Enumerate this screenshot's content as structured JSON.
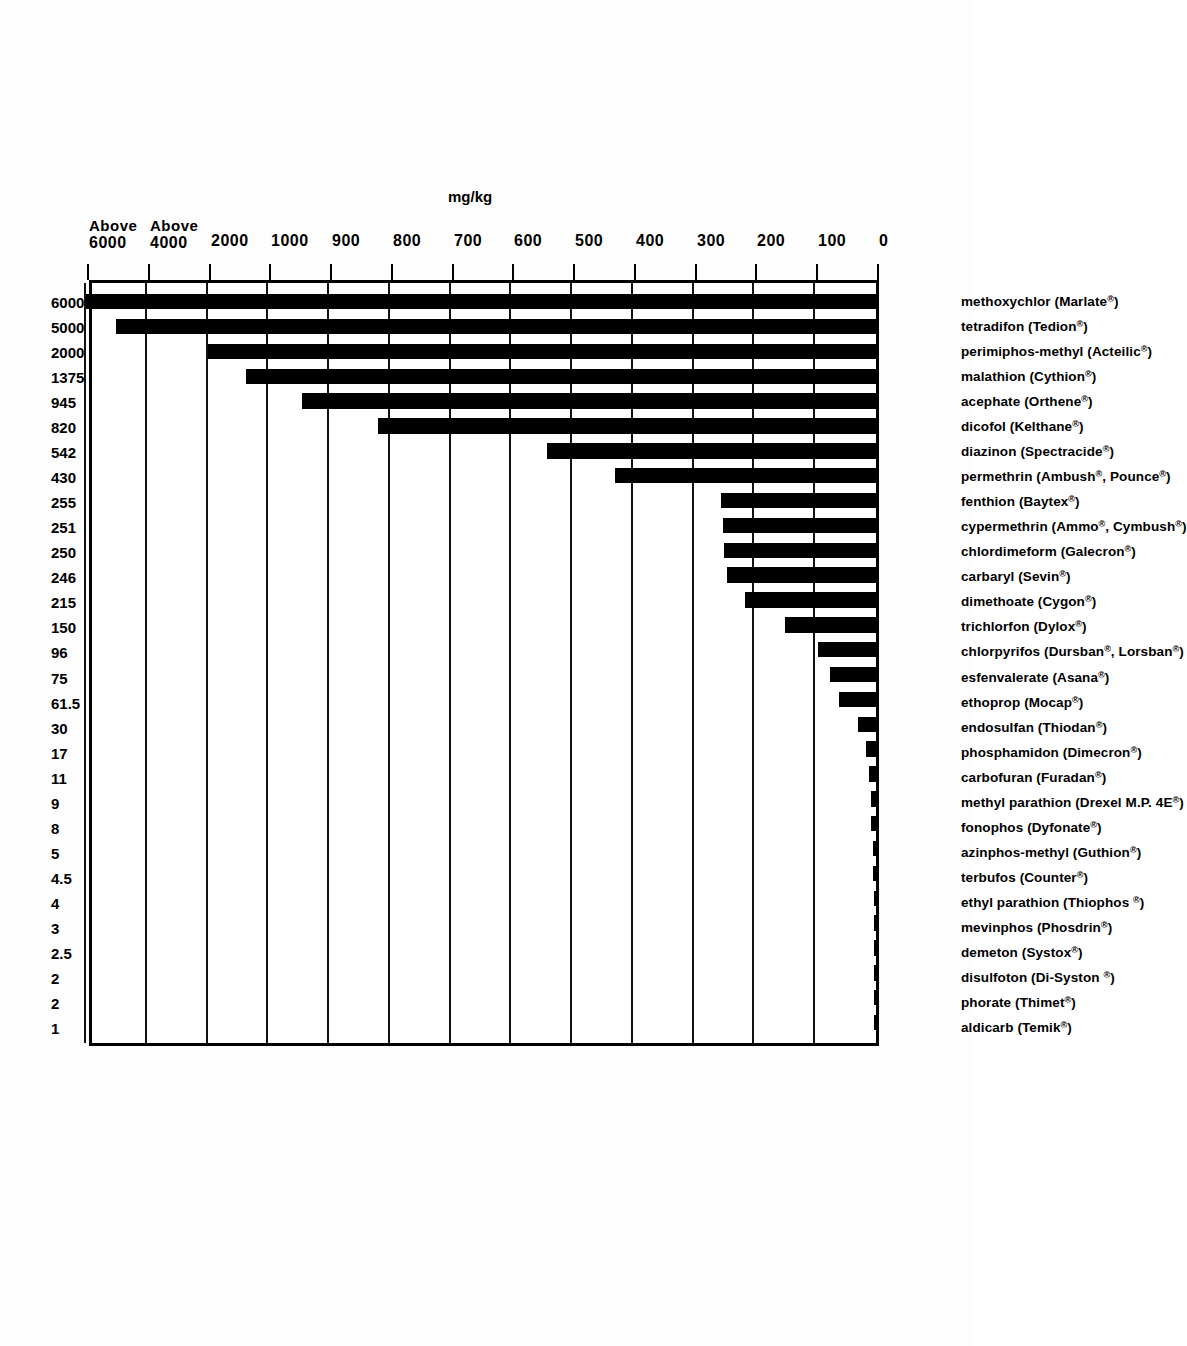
{
  "chart_data": {
    "type": "bar",
    "title_line1_main": "ACUTE ORAL LD",
    "title_line1_sub": "50",
    "title_line1_tail": "Rats mg/kg",
    "subtitle_line1": "The shorter the bar-the more toxic the chemical",
    "subtitle_line2": "if ingested",
    "xlabel": "",
    "ylabel": "mg/kg",
    "unit_label": "mg/kg",
    "grid": true,
    "legend": "none",
    "axis_scale": "piecewise / non-linear (0-1000 linear by 100, then 2000, Above 4000, Above 6000)",
    "tick_labels": [
      "0",
      "100",
      "200",
      "300",
      "400",
      "500",
      "600",
      "700",
      "800",
      "900",
      "1000",
      "2000",
      "Above 4000",
      "Above 6000"
    ],
    "tick_values": [
      0,
      100,
      200,
      300,
      400,
      500,
      600,
      700,
      800,
      900,
      1000,
      2000,
      4000,
      6000
    ],
    "categories": [
      "aldicarb (Temik®)",
      "phorate (Thimet®)",
      "disulfoton (Di-Syston ®)",
      "demeton (Systox®)",
      "mevinphos (Phosdrin®)",
      "ethyl parathion (Thiophos ®)",
      "terbufos (Counter®)",
      "azinphos-methyl (Guthion®)",
      "fonophos (Dyfonate®)",
      "methyl parathion (Drexel M.P. 4E®)",
      "carbofuran (Furadan®)",
      "phosphamidon (Dimecron®)",
      "endosulfan (Thiodan®)",
      "ethoprop (Mocap®)",
      "esfenvalerate (Asana®)",
      "chlorpyrifos (Dursban®, Lorsban®)",
      "trichlorfon (Dylox®)",
      "dimethoate (Cygon®)",
      "carbaryl (Sevin®)",
      "chlordimeform (Galecron®)",
      "cypermethrin (Ammo®, Cymbush®)",
      "fenthion (Baytex®)",
      "permethrin (Ambush®, Pounce®)",
      "diazinon (Spectracide®)",
      "dicofol (Kelthane®)",
      "acephate (Orthene®)",
      "malathion (Cythion®)",
      "perimiphos-methyl (Acteilic®)",
      "tetradifon (Tedion®)",
      "methoxychlor (Marlate®)"
    ],
    "values": [
      1,
      2,
      2,
      2.5,
      3,
      4,
      4.5,
      5,
      8,
      9,
      11,
      17,
      30,
      61.5,
      75,
      96,
      150,
      215,
      246,
      250,
      251,
      255,
      430,
      542,
      820,
      945,
      1375,
      2000,
      5000,
      6000
    ],
    "value_labels": [
      "1",
      "2",
      "2",
      "2.5",
      "3",
      "4",
      "4.5",
      "5",
      "8",
      "9",
      "11",
      "17",
      "30",
      "61.5",
      "75",
      "96",
      "150",
      "215",
      "246",
      "250",
      "251",
      "255",
      "430",
      "542",
      "820",
      "945",
      "1375",
      "2000",
      "5000",
      "6000"
    ]
  },
  "axis": {
    "ticks": [
      {
        "label": "0",
        "value": 0
      },
      {
        "label": "100",
        "value": 100
      },
      {
        "label": "200",
        "value": 200
      },
      {
        "label": "300",
        "value": 300
      },
      {
        "label": "400",
        "value": 400
      },
      {
        "label": "500",
        "value": 500
      },
      {
        "label": "600",
        "value": 600
      },
      {
        "label": "700",
        "value": 700
      },
      {
        "label": "800",
        "value": 800
      },
      {
        "label": "900",
        "value": 900
      },
      {
        "label": "1000",
        "value": 1000
      },
      {
        "label": "2000",
        "value": 2000
      },
      {
        "label": "Above 4000",
        "value": 4000,
        "prefix": "Above",
        "number": "4000"
      },
      {
        "label": "Above 6000",
        "value": 6000,
        "prefix": "Above",
        "number": "6000"
      }
    ]
  },
  "colors": {
    "bar": "#000000",
    "axis": "#000000",
    "background": "#ffffff",
    "text": "#000000"
  }
}
